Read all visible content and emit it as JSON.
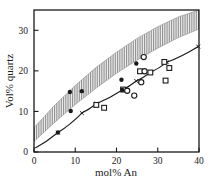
{
  "chart_data": {
    "type": "scatter",
    "title": "",
    "xlabel": "mol% An",
    "ylabel": "Vol% quartz",
    "xlim": [
      0,
      40
    ],
    "ylim": [
      0,
      35
    ],
    "xticks": [
      0,
      10,
      20,
      30,
      40
    ],
    "yticks": [
      0,
      10,
      20,
      30
    ],
    "grid": false,
    "legend": "none",
    "series": [
      {
        "name": "filled-circles",
        "marker": "filled-circle",
        "color": "#1a1a1a",
        "points": [
          {
            "x": 5.8,
            "y": 4.8
          },
          {
            "x": 8.7,
            "y": 14.8
          },
          {
            "x": 8.9,
            "y": 10.1
          },
          {
            "x": 11.6,
            "y": 15.0
          },
          {
            "x": 21.2,
            "y": 17.8
          },
          {
            "x": 21.4,
            "y": 15.3
          },
          {
            "x": 24.8,
            "y": 21.8
          }
        ]
      },
      {
        "name": "open-circles",
        "marker": "open-circle",
        "color": "#1a1a1a",
        "points": [
          {
            "x": 22.6,
            "y": 15.1
          },
          {
            "x": 24.3,
            "y": 13.9
          },
          {
            "x": 26.0,
            "y": 17.2
          },
          {
            "x": 26.6,
            "y": 23.4
          },
          {
            "x": 26.8,
            "y": 19.9
          }
        ]
      },
      {
        "name": "open-squares",
        "marker": "open-square",
        "color": "#1a1a1a",
        "points": [
          {
            "x": 15.1,
            "y": 11.6
          },
          {
            "x": 17.0,
            "y": 10.9
          },
          {
            "x": 21.6,
            "y": 15.4
          },
          {
            "x": 25.7,
            "y": 19.9
          },
          {
            "x": 28.2,
            "y": 19.6
          },
          {
            "x": 31.6,
            "y": 22.2
          },
          {
            "x": 31.9,
            "y": 17.6
          },
          {
            "x": 32.8,
            "y": 20.7
          }
        ]
      },
      {
        "name": "model-curve",
        "marker": "x-cross",
        "color": "#1a1a1a",
        "line": true,
        "points": [
          {
            "x": 0.3,
            "y": 1.0
          },
          {
            "x": 5.8,
            "y": 4.8
          },
          {
            "x": 11.6,
            "y": 9.6
          },
          {
            "x": 15.1,
            "y": 11.9
          },
          {
            "x": 21.4,
            "y": 15.3
          },
          {
            "x": 24.8,
            "y": 17.5
          },
          {
            "x": 28.2,
            "y": 19.6
          },
          {
            "x": 32.2,
            "y": 22.1
          },
          {
            "x": 39.8,
            "y": 26.0
          }
        ]
      }
    ],
    "band": {
      "name": "hatched-band",
      "fill": "hatched-vertical-gray",
      "color": "#9a9a9a",
      "upper": [
        {
          "x": 0.0,
          "y": 6.0
        },
        {
          "x": 5.0,
          "y": 11.5
        },
        {
          "x": 10.0,
          "y": 16.4
        },
        {
          "x": 15.0,
          "y": 20.8
        },
        {
          "x": 20.0,
          "y": 24.6
        },
        {
          "x": 25.0,
          "y": 28.0
        },
        {
          "x": 30.0,
          "y": 30.9
        },
        {
          "x": 35.0,
          "y": 33.3
        },
        {
          "x": 40.0,
          "y": 35.0
        }
      ],
      "lower": [
        {
          "x": 0.0,
          "y": 2.6
        },
        {
          "x": 5.0,
          "y": 7.3
        },
        {
          "x": 10.0,
          "y": 11.7
        },
        {
          "x": 15.0,
          "y": 15.7
        },
        {
          "x": 20.0,
          "y": 19.4
        },
        {
          "x": 25.0,
          "y": 22.7
        },
        {
          "x": 30.0,
          "y": 25.6
        },
        {
          "x": 35.0,
          "y": 28.2
        },
        {
          "x": 40.0,
          "y": 30.3
        }
      ]
    }
  },
  "axes": {
    "x_label": "mol%  An",
    "y_label": "Vol% quartz",
    "x_tick_labels": [
      "0",
      "10",
      "20",
      "30",
      "40"
    ],
    "y_tick_labels": [
      "0",
      "10",
      "20",
      "30"
    ]
  },
  "colors": {
    "ink": "#1a1a1a",
    "band": "#9a9a9a",
    "background": "#ffffff"
  }
}
